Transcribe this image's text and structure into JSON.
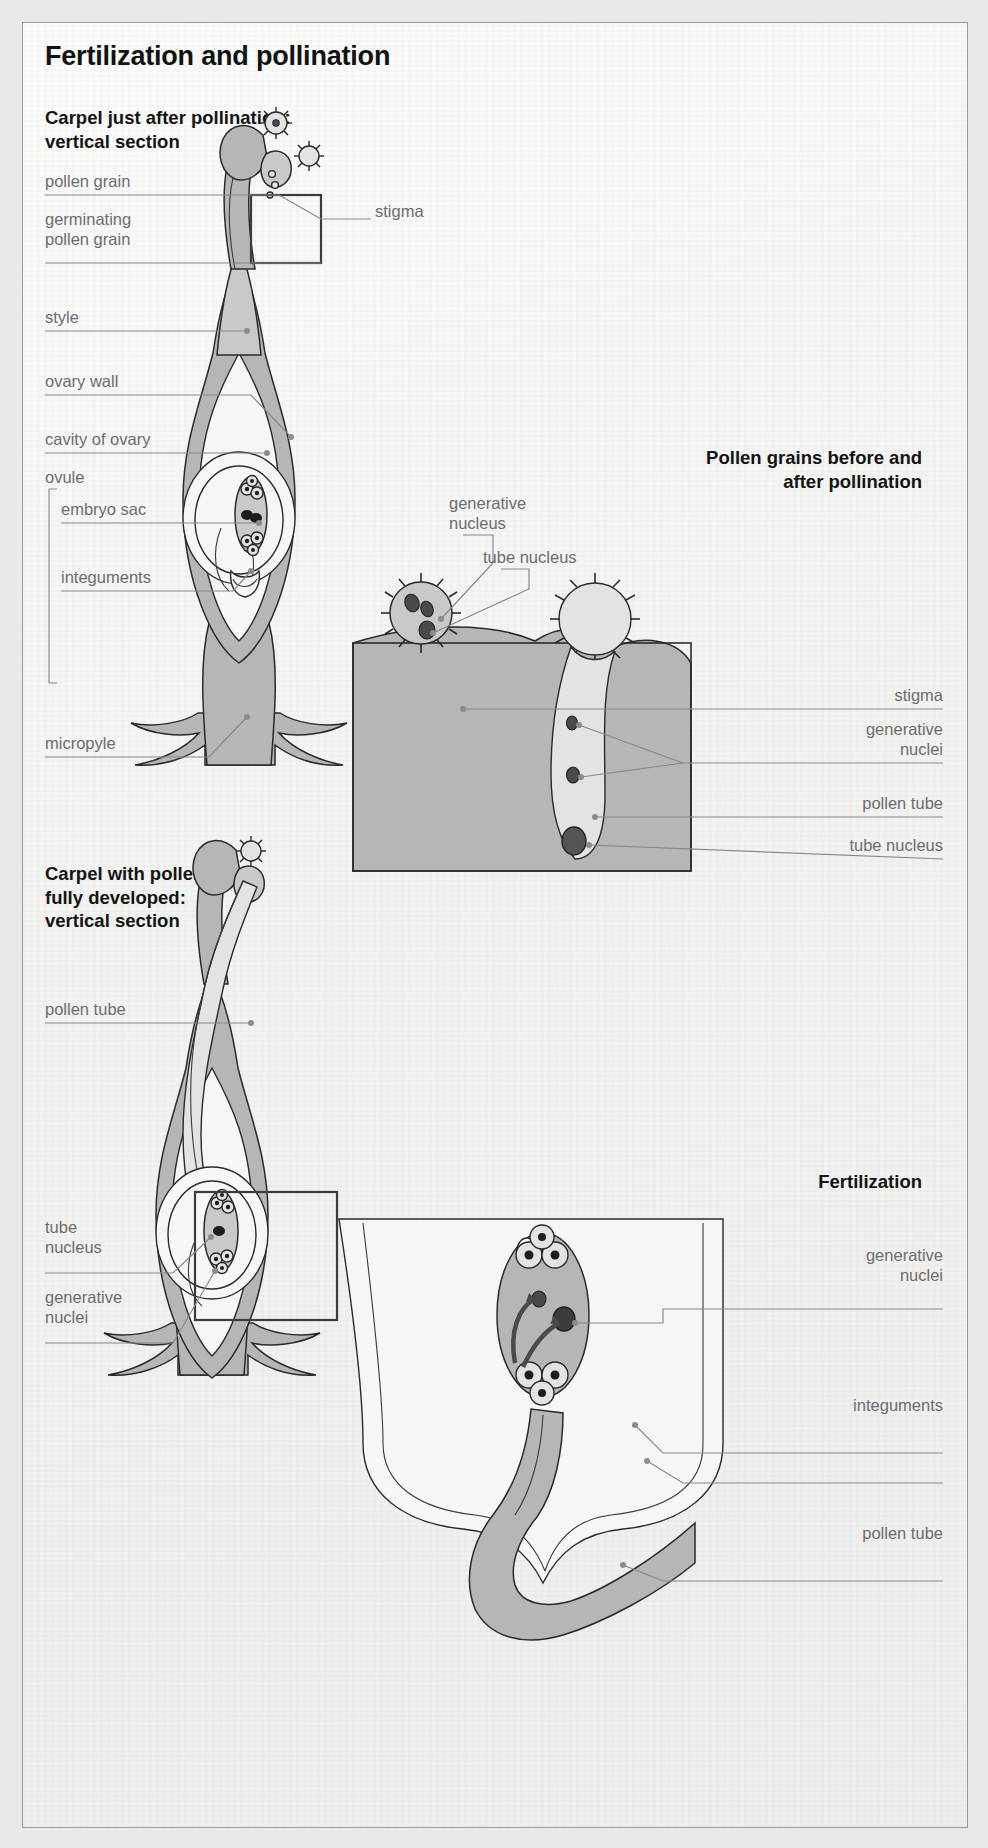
{
  "page": {
    "title": "Fertilization and pollination",
    "background_color": "#f7f7f5",
    "tissue_color": "#b6b6b6",
    "label_color": "#6d6d6d",
    "heading_color": "#141414"
  },
  "sections": [
    {
      "id": "carpel-after-pollination",
      "heading": "Carpel just after pollination:\nvertical section"
    },
    {
      "id": "pollen-grains",
      "heading": "Pollen grains before and\nafter pollination"
    },
    {
      "id": "carpel-pollen-tube",
      "heading": "Carpel with pollen tube\nfully developed:\nvertical section"
    },
    {
      "id": "fertilization",
      "heading": "Fertilization"
    }
  ],
  "labels": {
    "carpel_after": [
      {
        "id": "pollen-grain",
        "text": "pollen grain"
      },
      {
        "id": "germinating-pollen-grain",
        "text": "germinating\npollen grain"
      },
      {
        "id": "stigma",
        "text": "stigma"
      },
      {
        "id": "style",
        "text": "style"
      },
      {
        "id": "ovary-wall",
        "text": "ovary wall"
      },
      {
        "id": "cavity-of-ovary",
        "text": "cavity of ovary"
      },
      {
        "id": "ovule",
        "text": "ovule"
      },
      {
        "id": "embryo-sac",
        "text": "embryo sac"
      },
      {
        "id": "integuments",
        "text": "integuments"
      },
      {
        "id": "micropyle",
        "text": "micropyle"
      }
    ],
    "pollen_grains": [
      {
        "id": "generative-nucleus",
        "text": "generative\nnucleus"
      },
      {
        "id": "tube-nucleus",
        "text": "tube nucleus"
      },
      {
        "id": "stigma",
        "text": "stigma"
      },
      {
        "id": "generative-nuclei",
        "text": "generative\nnuclei"
      },
      {
        "id": "pollen-tube",
        "text": "pollen tube"
      },
      {
        "id": "tube-nucleus-2",
        "text": "tube nucleus"
      }
    ],
    "carpel_tube": [
      {
        "id": "pollen-tube",
        "text": "pollen tube"
      },
      {
        "id": "tube-nucleus",
        "text": "tube\nnucleus"
      },
      {
        "id": "generative-nuclei",
        "text": "generative\nnuclei"
      }
    ],
    "fertilization": [
      {
        "id": "generative-nuclei",
        "text": "generative\nnuclei"
      },
      {
        "id": "integuments",
        "text": "integuments"
      },
      {
        "id": "pollen-tube",
        "text": "pollen tube"
      }
    ]
  }
}
